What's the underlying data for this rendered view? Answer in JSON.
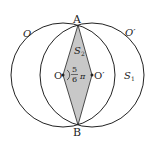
{
  "diagram": {
    "labels": {
      "circle_O": "O",
      "circle_O_prime": "O′",
      "point_A": "A",
      "point_B": "B",
      "center_O": "O",
      "center_O_prime": "O′",
      "region_S1": "S",
      "region_S1_sub": "1",
      "region_S2": "S",
      "region_S2_sub": "2",
      "angle_num": "5",
      "angle_den": "6",
      "angle_pi": "π"
    },
    "colors": {
      "s1_fill": "#8c8c8c",
      "s2_fill": "#c8c8c8",
      "stroke": "#222222"
    }
  }
}
